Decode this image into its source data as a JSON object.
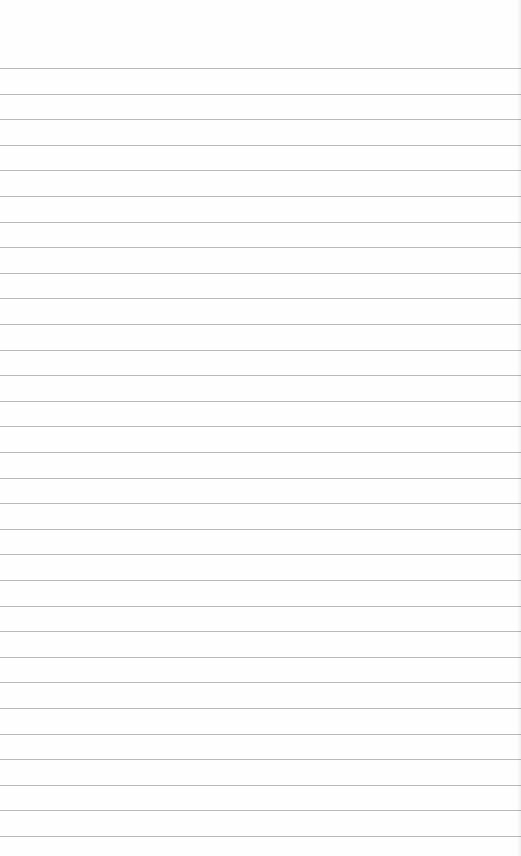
{
  "page": {
    "type": "lined-paper",
    "background_color": "#fefefe",
    "rule_color": "#b9b9b9",
    "rule_count": 31,
    "first_rule_y": 68,
    "rule_spacing": 25.6
  }
}
